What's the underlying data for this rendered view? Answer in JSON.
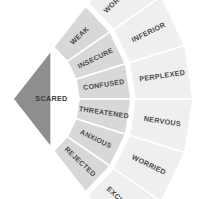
{
  "diagram": {
    "geometry": {
      "apex_x": 13,
      "apex_y": 99,
      "r_core": 62,
      "r_mid_inner": 66,
      "r_mid_outer": 118,
      "r_outer_inner": 122,
      "r_outer_outer": 180,
      "angle_start": -52,
      "angle_end": 52
    },
    "colors": {
      "background": "#ffffff",
      "core_fill": "#8e8e8e",
      "mid_fill": "#d8d8d8",
      "outer_fill": "#efefef",
      "divider": "#ffffff",
      "label_text": "#4a4a4a",
      "core_label_text": "#3a3a3a"
    },
    "core": {
      "label": "SCARED",
      "font_size": 7.2
    },
    "middle_ring": {
      "font_size": 7.0,
      "segments": [
        {
          "label": "WEAK"
        },
        {
          "label": "INSECURE"
        },
        {
          "label": "CONFUSED"
        },
        {
          "label": "THREATENED"
        },
        {
          "label": "ANXIOUS"
        },
        {
          "label": "REJECTED"
        }
      ]
    },
    "outer_ring": {
      "font_size": 7.2,
      "segments": [
        {
          "label": "WORTHLESS"
        },
        {
          "label": "INFERIOR"
        },
        {
          "label": "PERPLEXED"
        },
        {
          "label": "NERVOUS"
        },
        {
          "label": "WORRIED"
        },
        {
          "label": "EXCLUDED"
        }
      ]
    }
  }
}
